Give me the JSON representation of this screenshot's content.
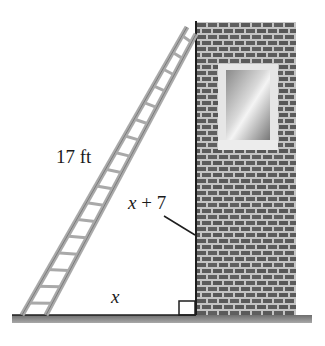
{
  "diagram": {
    "labels": {
      "hypotenuse": "17 ft",
      "vertical_var": "x",
      "vertical_rest": " + 7",
      "base": "x"
    },
    "elements": {
      "ladder": {
        "rungs": 17,
        "rail_color": "#a9a9a9",
        "outline_color": "#6f6f6f"
      },
      "wall": {
        "brick_color": "#5a5a5a",
        "mortar_color": "#c4c4c4",
        "edge_color": "#1e1e1e"
      },
      "window": {
        "frame_color": "#e6e6e6",
        "glass_color_light": "#f2f2f2",
        "glass_color_dark": "#7d7d7d"
      },
      "ground": {
        "color": "#8a8a8a"
      },
      "right_angle_marker": true
    }
  }
}
